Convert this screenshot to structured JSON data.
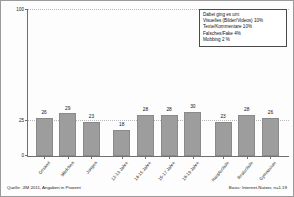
{
  "chart_data": {
    "type": "bar",
    "title": "",
    "xlabel": "",
    "ylabel": "",
    "ylim": [
      0,
      100
    ],
    "grid": true,
    "yticks": [
      "0",
      "25",
      "100"
    ],
    "ytick_values": [
      0,
      25,
      100
    ],
    "categories": [
      "Gesamt",
      "Mädchen",
      "Jungen",
      "12-13 Jahre",
      "14-15 Jahre",
      "16-17 Jahre",
      "18-19 Jahre",
      "Hauptschule",
      "Realschule",
      "Gymnasium"
    ],
    "values": [
      26,
      29,
      23,
      18,
      28,
      28,
      30,
      23,
      28,
      26
    ],
    "series": [
      {
        "name": "Schon mal erlebt, dass jemand im Internet fertiggemacht wurde",
        "values": [
          26,
          29,
          23,
          18,
          28,
          28,
          30,
          23,
          28,
          26
        ]
      }
    ],
    "bar_color": "#9d9d9d",
    "legend_position": "top-right"
  },
  "legend": {
    "title": "Dabei ging es um:",
    "items": [
      "Visuelles (Bilder/Videos) 10%",
      "Texte/Kommentare 10%",
      "Falsches/Fake 4%",
      "Mobbing 2 %"
    ]
  },
  "footer": {
    "source": "Quelle: JIM 2011, Angaben in Prozent",
    "basis": "Basis: Internet-Nutzer, n=1.19"
  }
}
